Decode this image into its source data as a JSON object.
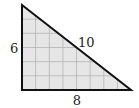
{
  "diagram": {
    "type": "right-triangle-on-grid",
    "grid": {
      "columns": 8,
      "rows": 6
    },
    "labels": {
      "vertical_leg": "6",
      "hypotenuse": "10",
      "horizontal_leg": "8"
    },
    "colors": {
      "fill": "#e6e6e6",
      "grid": "#b4b4b4",
      "outline": "#111111",
      "text": "#222222"
    }
  }
}
